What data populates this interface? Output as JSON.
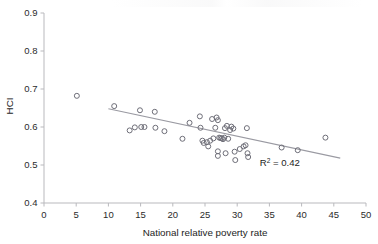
{
  "figure": {
    "background_color": "#ffffff",
    "marker_color": "#6e6e78",
    "trendline_color": "#9a9aa2",
    "axis_color": "#b9b9bd",
    "text_color": "#1d1d1d"
  },
  "chart_data": {
    "type": "scatter",
    "title": "",
    "xlabel": "National relative poverty rate",
    "ylabel": "HCI",
    "xlim": [
      0,
      50
    ],
    "ylim": [
      0.4,
      0.9
    ],
    "xticks": [
      0,
      5,
      10,
      15,
      20,
      25,
      30,
      35,
      40,
      45,
      50
    ],
    "xtick_labels": [
      "0",
      "5",
      "10",
      "15",
      "20",
      "25",
      "30",
      "35",
      "40",
      "45",
      "50"
    ],
    "yticks": [
      0.4,
      0.5,
      0.6,
      0.7,
      0.8,
      0.9
    ],
    "ytick_labels": [
      "0.4",
      "0.5",
      "0.6",
      "0.7",
      "0.8",
      "0.9"
    ],
    "grid": false,
    "legend": null,
    "marker_style": "open-circle",
    "annotations": [
      {
        "name": "r-squared-annotation",
        "text_prefix": "R",
        "text_superscript": "2",
        "text_suffix": " = 0.42",
        "full_text": "R2 = 0.42",
        "value": 0.42,
        "x": 33.5,
        "y": 0.497
      }
    ],
    "trendline": {
      "type": "linear",
      "x_start": 10.0,
      "y_start": 0.648,
      "x_end": 46.0,
      "y_end": 0.518,
      "slope": -0.00361,
      "intercept": 0.6841,
      "r_squared": 0.42
    },
    "points": [
      {
        "x": 5.1,
        "y": 0.682
      },
      {
        "x": 10.9,
        "y": 0.655
      },
      {
        "x": 13.3,
        "y": 0.591
      },
      {
        "x": 14.1,
        "y": 0.599
      },
      {
        "x": 14.9,
        "y": 0.644
      },
      {
        "x": 15.1,
        "y": 0.6
      },
      {
        "x": 15.6,
        "y": 0.6
      },
      {
        "x": 17.2,
        "y": 0.64
      },
      {
        "x": 17.3,
        "y": 0.598
      },
      {
        "x": 18.7,
        "y": 0.589
      },
      {
        "x": 21.5,
        "y": 0.569
      },
      {
        "x": 22.6,
        "y": 0.611
      },
      {
        "x": 24.2,
        "y": 0.628
      },
      {
        "x": 24.3,
        "y": 0.598
      },
      {
        "x": 24.6,
        "y": 0.564
      },
      {
        "x": 24.8,
        "y": 0.558
      },
      {
        "x": 25.3,
        "y": 0.56
      },
      {
        "x": 25.5,
        "y": 0.549
      },
      {
        "x": 25.8,
        "y": 0.564
      },
      {
        "x": 26.1,
        "y": 0.621
      },
      {
        "x": 26.3,
        "y": 0.57
      },
      {
        "x": 26.6,
        "y": 0.598
      },
      {
        "x": 26.8,
        "y": 0.625
      },
      {
        "x": 27.0,
        "y": 0.618
      },
      {
        "x": 27.0,
        "y": 0.536
      },
      {
        "x": 27.0,
        "y": 0.524
      },
      {
        "x": 27.2,
        "y": 0.572
      },
      {
        "x": 27.4,
        "y": 0.571
      },
      {
        "x": 27.6,
        "y": 0.57
      },
      {
        "x": 27.8,
        "y": 0.568
      },
      {
        "x": 28.0,
        "y": 0.572
      },
      {
        "x": 28.1,
        "y": 0.597
      },
      {
        "x": 28.2,
        "y": 0.531
      },
      {
        "x": 28.4,
        "y": 0.603
      },
      {
        "x": 28.6,
        "y": 0.569
      },
      {
        "x": 28.9,
        "y": 0.592
      },
      {
        "x": 29.1,
        "y": 0.601
      },
      {
        "x": 29.4,
        "y": 0.596
      },
      {
        "x": 29.6,
        "y": 0.535
      },
      {
        "x": 29.7,
        "y": 0.513
      },
      {
        "x": 30.4,
        "y": 0.542
      },
      {
        "x": 31.0,
        "y": 0.549
      },
      {
        "x": 31.3,
        "y": 0.552
      },
      {
        "x": 31.5,
        "y": 0.597
      },
      {
        "x": 31.6,
        "y": 0.531
      },
      {
        "x": 31.7,
        "y": 0.521
      },
      {
        "x": 36.9,
        "y": 0.546
      },
      {
        "x": 39.4,
        "y": 0.539
      },
      {
        "x": 43.7,
        "y": 0.572
      }
    ]
  }
}
